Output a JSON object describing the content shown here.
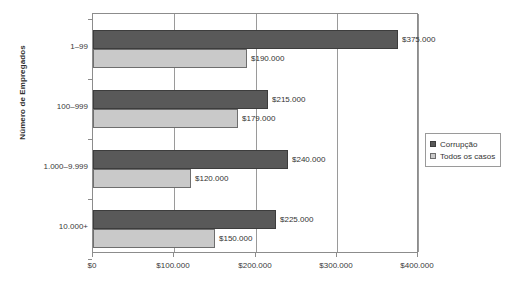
{
  "chart_data": {
    "type": "bar",
    "orientation": "horizontal",
    "title": "",
    "xlabel": "",
    "ylabel": "Número de Empregados",
    "categories": [
      "1–99",
      "100–999",
      "1.000–9.999",
      "10.000+"
    ],
    "series": [
      {
        "name": "Corrupção",
        "color": "#595959",
        "values": [
          375000,
          215000,
          240000,
          225000
        ],
        "labels": [
          "$375.000",
          "$215.000",
          "$240.000",
          "$225.000"
        ]
      },
      {
        "name": "Todos os casos",
        "color": "#c9c9c9",
        "values": [
          190000,
          179000,
          120000,
          150000
        ],
        "labels": [
          "$190.000",
          "$179.000",
          "$120.000",
          "$150.000"
        ]
      }
    ],
    "xlim": [
      0,
      400000
    ],
    "x_ticks": [
      0,
      100000,
      200000,
      300000,
      400000
    ],
    "x_tick_labels": [
      "$0",
      "$100.000",
      "$200.000",
      "$300.000",
      "$400.000"
    ],
    "grid": "vertical",
    "legend_position": "right-bottom"
  },
  "legend": {
    "entries": [
      {
        "label": "Corrupção"
      },
      {
        "label": "Todos os casos"
      }
    ]
  },
  "axis": {
    "y_title": "Número de Empregados"
  }
}
